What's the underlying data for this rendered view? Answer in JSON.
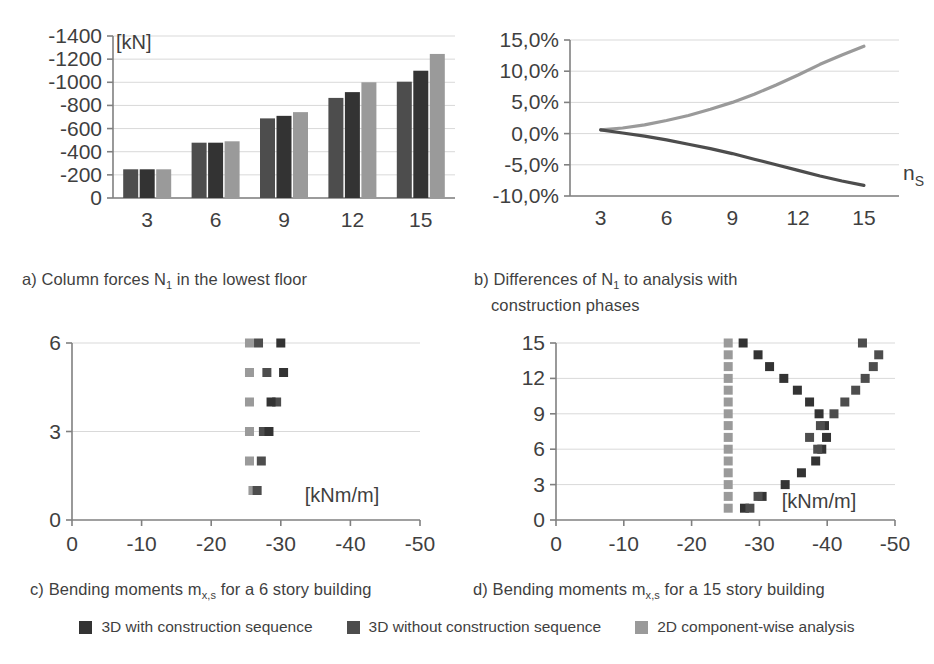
{
  "figure": {
    "colors": {
      "s1": "#4d4d4d",
      "s2": "#333333",
      "s3": "#9a9a9a",
      "axis": "#808080",
      "grid": "#d9d9d9",
      "text": "#3f3f3f"
    },
    "legend": [
      {
        "label": "3D with construction sequence",
        "color": "#333333",
        "name": "legend-item-3d-with-construction-sequence"
      },
      {
        "label": "3D without construction sequence",
        "color": "#4d4d4d",
        "name": "legend-item-3d-without-construction-sequence"
      },
      {
        "label": "2D component-wise analysis",
        "color": "#9a9a9a",
        "name": "legend-item-2d-component-wise-analysis"
      }
    ],
    "captions": {
      "a": "a) Column forces N₁ in the lowest floor",
      "b_line1": "b) Differences of N₁ to analysis with",
      "b_line2": "construction phases",
      "c": "c) Bending moments m",
      "c_sub": "x,s",
      "c_tail": " for a 6 story building",
      "d": "d) Bending moments m",
      "d_sub": "x,s",
      "d_tail": " for a 15 story building"
    }
  },
  "chart_data": [
    {
      "id": "chart-a",
      "type": "bar",
      "title": "a) Column forces N1 in the lowest floor",
      "xlabel": "",
      "ylabel": "[kN]",
      "unit": "[kN]",
      "categories": [
        "3",
        "6",
        "9",
        "12",
        "15"
      ],
      "ylim": [
        0,
        -1400
      ],
      "yticks": [
        "0",
        "-200",
        "-400",
        "-600",
        "-800",
        "-1000",
        "-1200",
        "-1400"
      ],
      "ytick_values": [
        0,
        -200,
        -400,
        -600,
        -800,
        -1000,
        -1200,
        -1400
      ],
      "grid": true,
      "series": [
        {
          "name": "3D without construction sequence",
          "color": "#4d4d4d",
          "values": [
            -248,
            -478,
            -688,
            -865,
            -1005
          ]
        },
        {
          "name": "3D with construction sequence",
          "color": "#333333",
          "values": [
            -248,
            -478,
            -710,
            -915,
            -1100
          ]
        },
        {
          "name": "2D component-wise analysis",
          "color": "#9a9a9a",
          "values": [
            -248,
            -490,
            -742,
            -1000,
            -1245
          ]
        }
      ]
    },
    {
      "id": "chart-b",
      "type": "line",
      "title": "b) Differences of N1 to analysis with construction phases",
      "xlabel": "n_S",
      "xlabel_base": "n",
      "xlabel_sub": "S",
      "ylabel": "",
      "xticks": [
        "3",
        "6",
        "9",
        "12",
        "15"
      ],
      "xtick_values": [
        3,
        6,
        9,
        12,
        15
      ],
      "yticks": [
        "15,0%",
        "10,0%",
        "5,0%",
        "0,0%",
        "-5,0%",
        "-10,0%"
      ],
      "ytick_values": [
        15,
        10,
        5,
        0,
        -5,
        -10
      ],
      "xlim": [
        1.6,
        16.6
      ],
      "ylim": [
        -10,
        15
      ],
      "grid": true,
      "series": [
        {
          "name": "2D component-wise analysis",
          "color": "#9a9a9a",
          "x": [
            3,
            4,
            5,
            6,
            7,
            8,
            9,
            10,
            11,
            12,
            13,
            14,
            15
          ],
          "y": [
            0.6,
            0.9,
            1.4,
            2.1,
            2.9,
            3.9,
            5.0,
            6.3,
            7.8,
            9.4,
            11.1,
            12.6,
            14.0
          ]
        },
        {
          "name": "3D without construction sequence",
          "color": "#4d4d4d",
          "x": [
            3,
            4,
            5,
            6,
            7,
            8,
            9,
            10,
            11,
            12,
            13,
            14,
            15
          ],
          "y": [
            0.6,
            0.1,
            -0.4,
            -1.0,
            -1.7,
            -2.4,
            -3.2,
            -4.1,
            -5.0,
            -5.9,
            -6.8,
            -7.6,
            -8.3
          ]
        }
      ]
    },
    {
      "id": "chart-c",
      "type": "scatter",
      "title": "c) Bending moments mx,s for a 6 story building",
      "xlabel": "[kNm/m]",
      "unit": "[kNm/m]",
      "ylabel": "",
      "xticks": [
        "0",
        "-10",
        "-20",
        "-30",
        "-40",
        "-50"
      ],
      "xtick_values": [
        0,
        -10,
        -20,
        -30,
        -40,
        -50
      ],
      "yticks": [
        "0",
        "3",
        "6"
      ],
      "ytick_values": [
        0,
        3,
        6
      ],
      "xlim": [
        0,
        -50
      ],
      "ylim": [
        0,
        6
      ],
      "grid": true,
      "series": [
        {
          "name": "2D component-wise analysis",
          "color": "#9a9a9a",
          "x": [
            -25.5,
            -25.5,
            -25.5,
            -25.5,
            -25.5,
            -26.0
          ],
          "y": [
            6,
            5,
            4,
            3,
            2,
            1
          ]
        },
        {
          "name": "3D without construction sequence",
          "color": "#4d4d4d",
          "x": [
            -26.8,
            -28.0,
            -29.4,
            -27.5,
            -27.2,
            -26.6
          ],
          "y": [
            6,
            5,
            4,
            3,
            2,
            1
          ]
        },
        {
          "name": "3D with construction sequence",
          "color": "#333333",
          "x": [
            -30.0,
            -30.4,
            -28.6,
            -28.3,
            null,
            null
          ],
          "y": [
            6,
            5,
            4,
            3,
            null,
            null
          ]
        }
      ]
    },
    {
      "id": "chart-d",
      "type": "scatter",
      "title": "d) Bending moments mx,s for a 15 story building",
      "xlabel": "[kNm/m]",
      "unit": "[kNm/m]",
      "ylabel": "",
      "xticks": [
        "0",
        "-10",
        "-20",
        "-30",
        "-40",
        "-50"
      ],
      "xtick_values": [
        0,
        -10,
        -20,
        -30,
        -40,
        -50
      ],
      "yticks": [
        "0",
        "3",
        "6",
        "9",
        "12",
        "15"
      ],
      "ytick_values": [
        0,
        3,
        6,
        9,
        12,
        15
      ],
      "xlim": [
        0,
        -50
      ],
      "ylim": [
        0,
        15
      ],
      "grid": true,
      "series": [
        {
          "name": "2D component-wise analysis",
          "color": "#9a9a9a",
          "x": [
            -25.4,
            -25.4,
            -25.4,
            -25.4,
            -25.4,
            -25.4,
            -25.4,
            -25.4,
            -25.4,
            -25.4,
            -25.4,
            -25.4,
            -25.4,
            -25.4,
            -25.4
          ],
          "y": [
            15,
            14,
            13,
            12,
            11,
            10,
            9,
            8,
            7,
            6,
            5,
            4,
            3,
            2,
            1
          ]
        },
        {
          "name": "3D with construction sequence",
          "color": "#333333",
          "x": [
            -27.6,
            -29.8,
            -31.5,
            -33.6,
            -35.6,
            -37.4,
            -38.8,
            -39.6,
            -39.9,
            -39.2,
            -38.3,
            -36.2,
            -33.8,
            -30.4,
            -27.8
          ],
          "y": [
            15,
            14,
            13,
            12,
            11,
            10,
            9,
            8,
            7,
            6,
            5,
            4,
            3,
            2,
            1
          ]
        },
        {
          "name": "3D without construction sequence",
          "color": "#4d4d4d",
          "x": [
            -45.2,
            -47.6,
            -46.8,
            -45.6,
            -44.2,
            -42.6,
            -41.0,
            -39.0,
            -37.4,
            -38.6,
            null,
            null,
            null,
            -29.8,
            -28.6
          ],
          "y": [
            15,
            14,
            13,
            12,
            11,
            10,
            9,
            8,
            7,
            6,
            null,
            null,
            null,
            2,
            1
          ]
        }
      ]
    }
  ]
}
